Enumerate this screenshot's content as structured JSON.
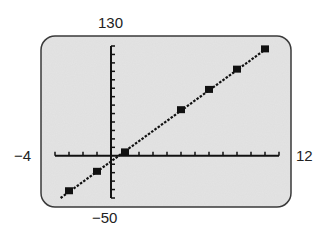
{
  "window": {
    "xmin_label": "−4",
    "xmax_label": "12",
    "ymin_label": "−50",
    "ymax_label": "130"
  },
  "colors": {
    "screen_bg": "#e4e4e4",
    "frame": "#3a3a3a",
    "ink": "#111111"
  },
  "chart_data": {
    "type": "scatter",
    "title": "",
    "xlabel": "",
    "ylabel": "",
    "xlim": [
      -4,
      12
    ],
    "ylim": [
      -50,
      130
    ],
    "xscale": 1,
    "yscale": 10,
    "grid": false,
    "legend": null,
    "series": [
      {
        "name": "data points",
        "marker": "square",
        "x": [
          -3,
          -1,
          1,
          5,
          7,
          9,
          11
        ],
        "y": [
          -42,
          -19,
          4,
          54,
          78,
          102,
          126
        ]
      },
      {
        "name": "regression line",
        "style": "dotted-line",
        "x": [
          -3.6,
          11.2
        ],
        "y": [
          -50,
          128
        ]
      }
    ]
  }
}
